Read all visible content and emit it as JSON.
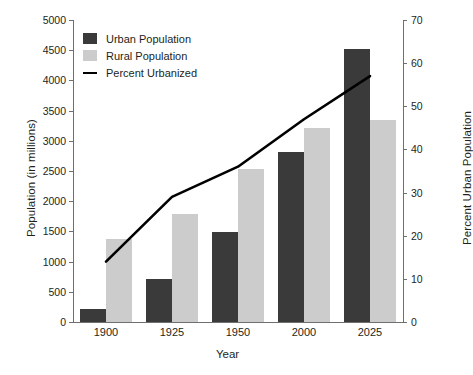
{
  "chart_data": {
    "type": "bar",
    "title": "",
    "xlabel": "Year",
    "ylabel": "Population (in millions)",
    "y2label": "Percent Urban Population",
    "categories": [
      "1900",
      "1925",
      "1950",
      "2000",
      "2025"
    ],
    "ylim": [
      0,
      5000
    ],
    "y2lim": [
      0,
      70
    ],
    "yticks": [
      "0",
      "500",
      "1000",
      "1500",
      "2000",
      "2500",
      "3000",
      "3500",
      "4000",
      "4500",
      "5000"
    ],
    "ytick_values": [
      0,
      500,
      1000,
      1500,
      2000,
      2500,
      3000,
      3500,
      4000,
      4500,
      5000
    ],
    "y2ticks": [
      "0",
      "10",
      "20",
      "30",
      "40",
      "50",
      "60",
      "70"
    ],
    "y2tick_values": [
      0,
      10,
      20,
      30,
      40,
      50,
      60,
      70
    ],
    "grid": false,
    "legend_position": "upper-left",
    "series": [
      {
        "name": "Urban Population",
        "type": "bar",
        "axis": "left",
        "color": "#3a3a3a",
        "values": [
          220,
          710,
          1490,
          2810,
          4520
        ]
      },
      {
        "name": "Rural Population",
        "type": "bar",
        "axis": "left",
        "color": "#cccccc",
        "values": [
          1380,
          1790,
          2530,
          3210,
          3340
        ]
      },
      {
        "name": "Percent Urbanized",
        "type": "line",
        "axis": "right",
        "color": "#000000",
        "values": [
          14,
          29,
          36,
          47,
          57
        ]
      }
    ]
  },
  "legend": {
    "items": [
      {
        "label": "Urban Population",
        "swatch": "urban"
      },
      {
        "label": "Rural Population",
        "swatch": "rural"
      },
      {
        "label": "Percent Urbanized",
        "swatch": "line"
      }
    ]
  },
  "axes": {
    "left_title": "Population (in millions)",
    "right_title": "Percent Urban Population",
    "bottom_title": "Year"
  }
}
